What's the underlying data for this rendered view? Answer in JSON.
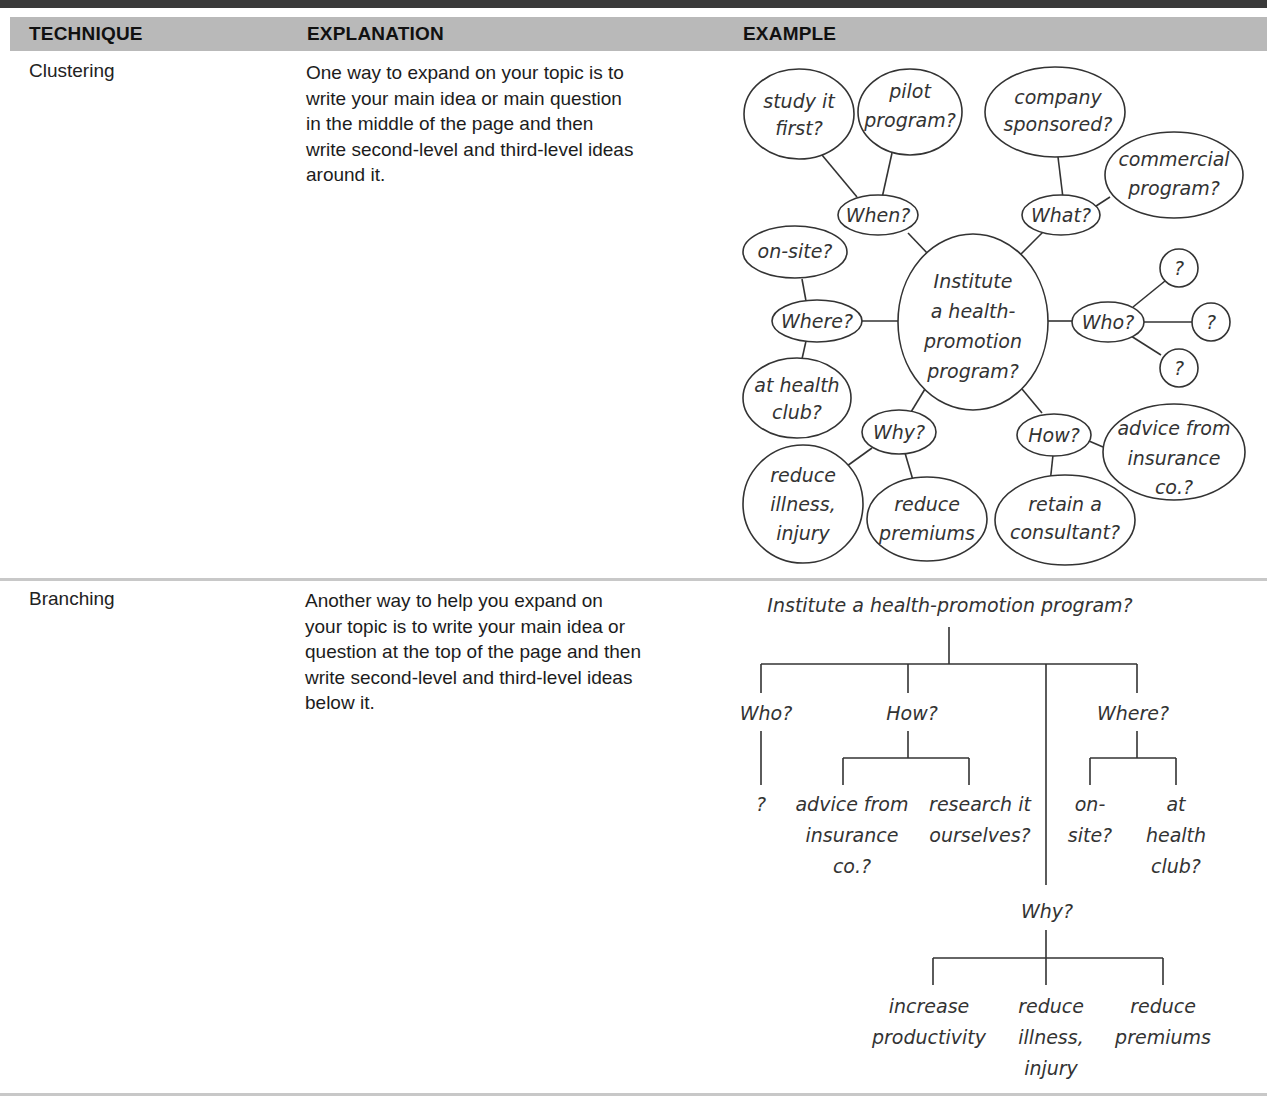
{
  "table": {
    "headers": [
      "TECHNIQUE",
      "EXPLANATION",
      "EXAMPLE"
    ],
    "rows": [
      {
        "technique": "Clustering",
        "explanation": [
          "One way to expand on your topic is to",
          "write your main idea or main question",
          "in the middle of the page and then",
          "write second-level and third-level ideas",
          "around it."
        ]
      },
      {
        "technique": "Branching",
        "explanation": [
          "Another way to help you expand on",
          "your topic is to write your main idea or",
          "question at the top of the page and then",
          "write second-level and third-level ideas",
          "below it."
        ]
      }
    ]
  },
  "cluster": {
    "center": [
      "Institute",
      "a health-",
      "promotion",
      "program?"
    ],
    "when": "When?",
    "when_children": [
      [
        "study it",
        "first?"
      ],
      [
        "pilot",
        "program?"
      ]
    ],
    "what": "What?",
    "what_children": [
      [
        "company",
        "sponsored?"
      ],
      [
        "commercial",
        "program?"
      ]
    ],
    "where": "Where?",
    "where_children": [
      [
        "on-site?"
      ],
      [
        "at health",
        "club?"
      ]
    ],
    "who": "Who?",
    "who_children": [
      "?",
      "?",
      "?"
    ],
    "why": "Why?",
    "why_children": [
      [
        "reduce",
        "illness,",
        "injury"
      ],
      [
        "reduce",
        "premiums"
      ]
    ],
    "how": "How?",
    "how_children": [
      [
        "advice from",
        "insurance",
        "co.?"
      ],
      [
        "retain a",
        "consultant?"
      ]
    ]
  },
  "branch": {
    "root": "Institute a health-promotion program?",
    "who": "Who?",
    "who_child": "?",
    "how": "How?",
    "how_children": [
      [
        "advice from",
        "insurance",
        "co.?"
      ],
      [
        "research it",
        "ourselves?"
      ]
    ],
    "where": "Where?",
    "where_children": [
      [
        "on-",
        "site?"
      ],
      [
        "at",
        "health",
        "club?"
      ]
    ],
    "why": "Why?",
    "why_children": [
      [
        "increase",
        "productivity"
      ],
      [
        "reduce",
        "illness,",
        "injury"
      ],
      [
        "reduce",
        "premiums"
      ]
    ]
  }
}
